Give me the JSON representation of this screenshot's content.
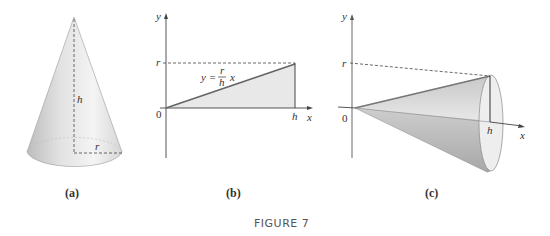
{
  "figure": {
    "caption": "FIGURE 7",
    "panels": [
      {
        "id": "a",
        "label": "(a)",
        "description": "Right circular cone with height h and base radius r",
        "labels": {
          "height": "h",
          "radius": "r"
        }
      },
      {
        "id": "b",
        "label": "(b)",
        "description": "Triangle region under line y = (r/h)x from 0 to h",
        "axes": {
          "x": "x",
          "y": "y",
          "origin": "0"
        },
        "ticks": {
          "x_tick": "h",
          "y_tick": "r"
        },
        "equation": {
          "lhs": "y =",
          "numerator": "r",
          "denominator": "h",
          "rhs": "x"
        }
      },
      {
        "id": "c",
        "label": "(c)",
        "description": "Cone obtained by rotating the triangle about the x-axis",
        "axes": {
          "x": "x",
          "y": "y",
          "origin": "0"
        },
        "ticks": {
          "x_tick": "h",
          "y_tick": "r"
        }
      }
    ]
  },
  "colors": {
    "stroke": "#333333",
    "fill_light": "#e6e6e6",
    "line_gray": "#666666"
  }
}
